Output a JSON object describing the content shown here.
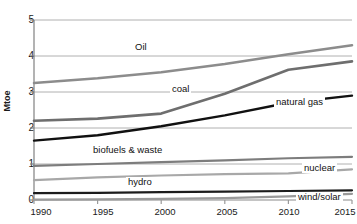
{
  "chart_data": {
    "type": "line",
    "title": "",
    "xlabel": "",
    "ylabel": "Mtoe",
    "x": [
      1990,
      1995,
      2000,
      2005,
      2010,
      2015
    ],
    "xticklabels": [
      "1990",
      "1995",
      "2000",
      "2005",
      "2010",
      "2015"
    ],
    "yticklabels": [
      "0",
      "1",
      "2",
      "3",
      "4",
      "5"
    ],
    "ylim": [
      0,
      5
    ],
    "xlim": [
      1990,
      2015
    ],
    "grid": "horizontal",
    "legend": "inline-labels",
    "series": [
      {
        "name": "Oil",
        "label": "Oil",
        "color": "#8c8c8c",
        "width": 2.6,
        "values": [
          3.25,
          3.38,
          3.55,
          3.78,
          4.05,
          4.3
        ]
      },
      {
        "name": "coal",
        "label": "coal",
        "color": "#6e6e6e",
        "width": 2.6,
        "values": [
          2.2,
          2.26,
          2.4,
          2.95,
          3.62,
          3.85
        ]
      },
      {
        "name": "natural gas",
        "label": "natural gas",
        "color": "#111111",
        "width": 2.4,
        "values": [
          1.65,
          1.8,
          2.05,
          2.35,
          2.7,
          2.9
        ]
      },
      {
        "name": "biofuels & waste",
        "label": "biofuels & waste",
        "color": "#7d7d7d",
        "width": 2.2,
        "values": [
          0.95,
          1.0,
          1.05,
          1.1,
          1.16,
          1.2
        ]
      },
      {
        "name": "nuclear",
        "label": "nuclear",
        "color": "#a8a8a8",
        "width": 2.2,
        "values": [
          0.55,
          0.63,
          0.68,
          0.72,
          0.74,
          0.85
        ]
      },
      {
        "name": "hydro",
        "label": "hydro",
        "color": "#1c1c1c",
        "width": 2.2,
        "values": [
          0.19,
          0.2,
          0.22,
          0.23,
          0.25,
          0.27
        ]
      },
      {
        "name": "wind/solar",
        "label": "wind/solar",
        "color": "#9a9a9a",
        "width": 2.2,
        "values": [
          0.01,
          0.02,
          0.03,
          0.05,
          0.1,
          0.17
        ]
      }
    ]
  }
}
